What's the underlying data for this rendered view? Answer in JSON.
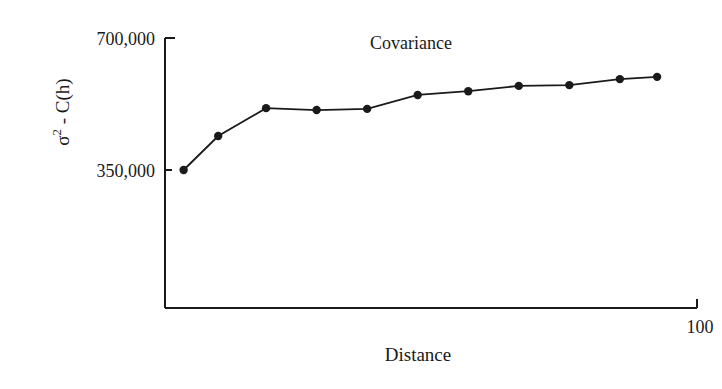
{
  "chart_data": {
    "type": "line",
    "title": "Covariance",
    "xlabel": "Distance",
    "ylabel": "σ² - C(h)",
    "ylabel_parts": {
      "sigma": "σ",
      "sup": "2",
      "rest": " - C(h)"
    },
    "x_tick_labels": [
      "100"
    ],
    "y_tick_labels": [
      "700,000",
      "350,000"
    ],
    "x_ticks": [
      100
    ],
    "y_ticks": [
      700000,
      350000
    ],
    "xlim": [
      0,
      100
    ],
    "ylim": [
      0,
      700000
    ],
    "grid": false,
    "legend": null,
    "series": [
      {
        "name": "Covariance",
        "marker": "filled-circle",
        "color": "#1a1a1a",
        "x": [
          3.5,
          10,
          19,
          28.5,
          38,
          47.5,
          57,
          66.5,
          76,
          85.5,
          92.5
        ],
        "values": [
          350000,
          440000,
          514000,
          509000,
          512000,
          549000,
          559000,
          573000,
          575000,
          591000,
          597000
        ]
      }
    ]
  }
}
